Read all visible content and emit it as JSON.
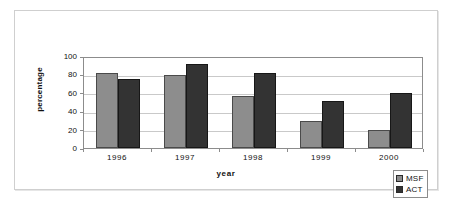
{
  "chart_data": {
    "type": "bar",
    "title": "",
    "subtitle": "",
    "xlabel": "year",
    "ylabel": "percentage",
    "categories": [
      "1996",
      "1997",
      "1998",
      "1999",
      "2000"
    ],
    "series": [
      {
        "name": "MSF",
        "color": "#8d8d8d",
        "values": [
          81,
          79,
          57,
          29,
          20
        ]
      },
      {
        "name": "ACT",
        "color": "#333333",
        "values": [
          75,
          91,
          81,
          51,
          60
        ]
      }
    ],
    "ylim": [
      0,
      100
    ],
    "ytick_values": [
      0,
      20,
      40,
      60,
      80,
      100
    ],
    "ytick_labels": [
      "0",
      "20",
      "40",
      "60",
      "80",
      "100"
    ],
    "grid": "horizontal",
    "legend_position": "bottom-right",
    "legend_entries": [
      "MSF",
      "ACT"
    ],
    "annotations": []
  },
  "axes": {
    "y_title": "percentage",
    "x_title": "year",
    "y_ticks": [
      "100",
      "80",
      "60",
      "40",
      "20",
      "0"
    ],
    "x_ticks": [
      "1996",
      "1997",
      "1998",
      "1999",
      "2000"
    ]
  },
  "legend": {
    "items": [
      {
        "label": "MSF",
        "color": "#8d8d8d"
      },
      {
        "label": "ACT",
        "color": "#333333"
      }
    ]
  },
  "colors": {
    "series_msf": "#8d8d8d",
    "series_act": "#333333",
    "gridline": "#c9c9c9",
    "axis": "#8c8c8c",
    "frame": "#cfcfcf",
    "background": "#ffffff",
    "text": "#111111"
  }
}
